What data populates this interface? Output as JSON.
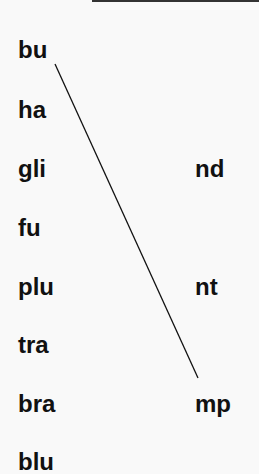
{
  "onsets": [
    "bu",
    "ha",
    "gli",
    "fu",
    "plu",
    "tra",
    "bra",
    "blu"
  ],
  "codas": [
    "nd",
    "nt",
    "mp"
  ],
  "connection": {
    "from": "bu",
    "to": "mp",
    "color": "#111111"
  }
}
